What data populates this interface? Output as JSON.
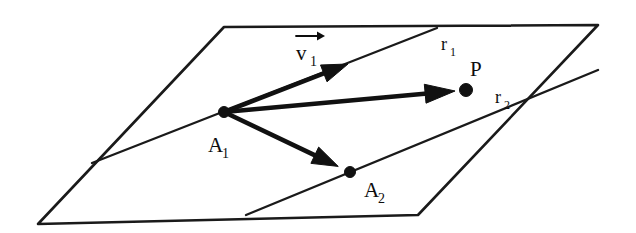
{
  "figure": {
    "kind": "geometry-diagram",
    "background_color": "#ffffff",
    "ink_color": "#111111",
    "labels": {
      "vector_v1": {
        "base": "v",
        "subscript": "1",
        "has_overhead_arrow": true,
        "x": 300,
        "y": 58
      },
      "ray_r1": {
        "base": "r",
        "subscript": "1",
        "x": 441,
        "y": 48
      },
      "ray_r2": {
        "base": "r",
        "subscript": "2",
        "x": 495,
        "y": 102
      },
      "point_p": {
        "base": "P",
        "subscript": "",
        "x": 470,
        "y": 74
      },
      "point_a1": {
        "base": "A",
        "subscript": "1",
        "x": 211,
        "y": 150
      },
      "point_a2": {
        "base": "A",
        "subscript": "2",
        "x": 367,
        "y": 195
      }
    },
    "plane": {
      "corners": [
        {
          "name": "top-left",
          "x": 224,
          "y": 27
        },
        {
          "name": "top-right",
          "x": 598,
          "y": 25
        },
        {
          "name": "bottom-right",
          "x": 418,
          "y": 215
        },
        {
          "name": "bottom-left",
          "x": 38,
          "y": 224
        }
      ]
    },
    "rays": [
      {
        "name": "r1",
        "from_x": 92,
        "from_y": 163,
        "to_x": 437,
        "to_y": 28
      },
      {
        "name": "r2",
        "from_x": 246,
        "from_y": 215,
        "to_x": 598,
        "to_y": 70
      }
    ],
    "nodes": [
      {
        "name": "A1",
        "x": 224,
        "y": 112,
        "radius": 5.5
      },
      {
        "name": "A2",
        "x": 350,
        "y": 172,
        "radius": 5.5
      },
      {
        "name": "P",
        "x": 466,
        "y": 90,
        "radius": 6.5
      }
    ],
    "vectors": [
      {
        "name": "v1",
        "from_x": 224,
        "from_y": 112,
        "to_x": 348,
        "to_y": 64,
        "label": "v1"
      },
      {
        "name": "A1-to-P",
        "from_x": 224,
        "from_y": 112,
        "to_x": 466,
        "to_y": 90,
        "label": "P"
      },
      {
        "name": "A1-to-A2",
        "from_x": 224,
        "from_y": 112,
        "to_x": 350,
        "to_y": 172,
        "label": "A2"
      }
    ]
  }
}
